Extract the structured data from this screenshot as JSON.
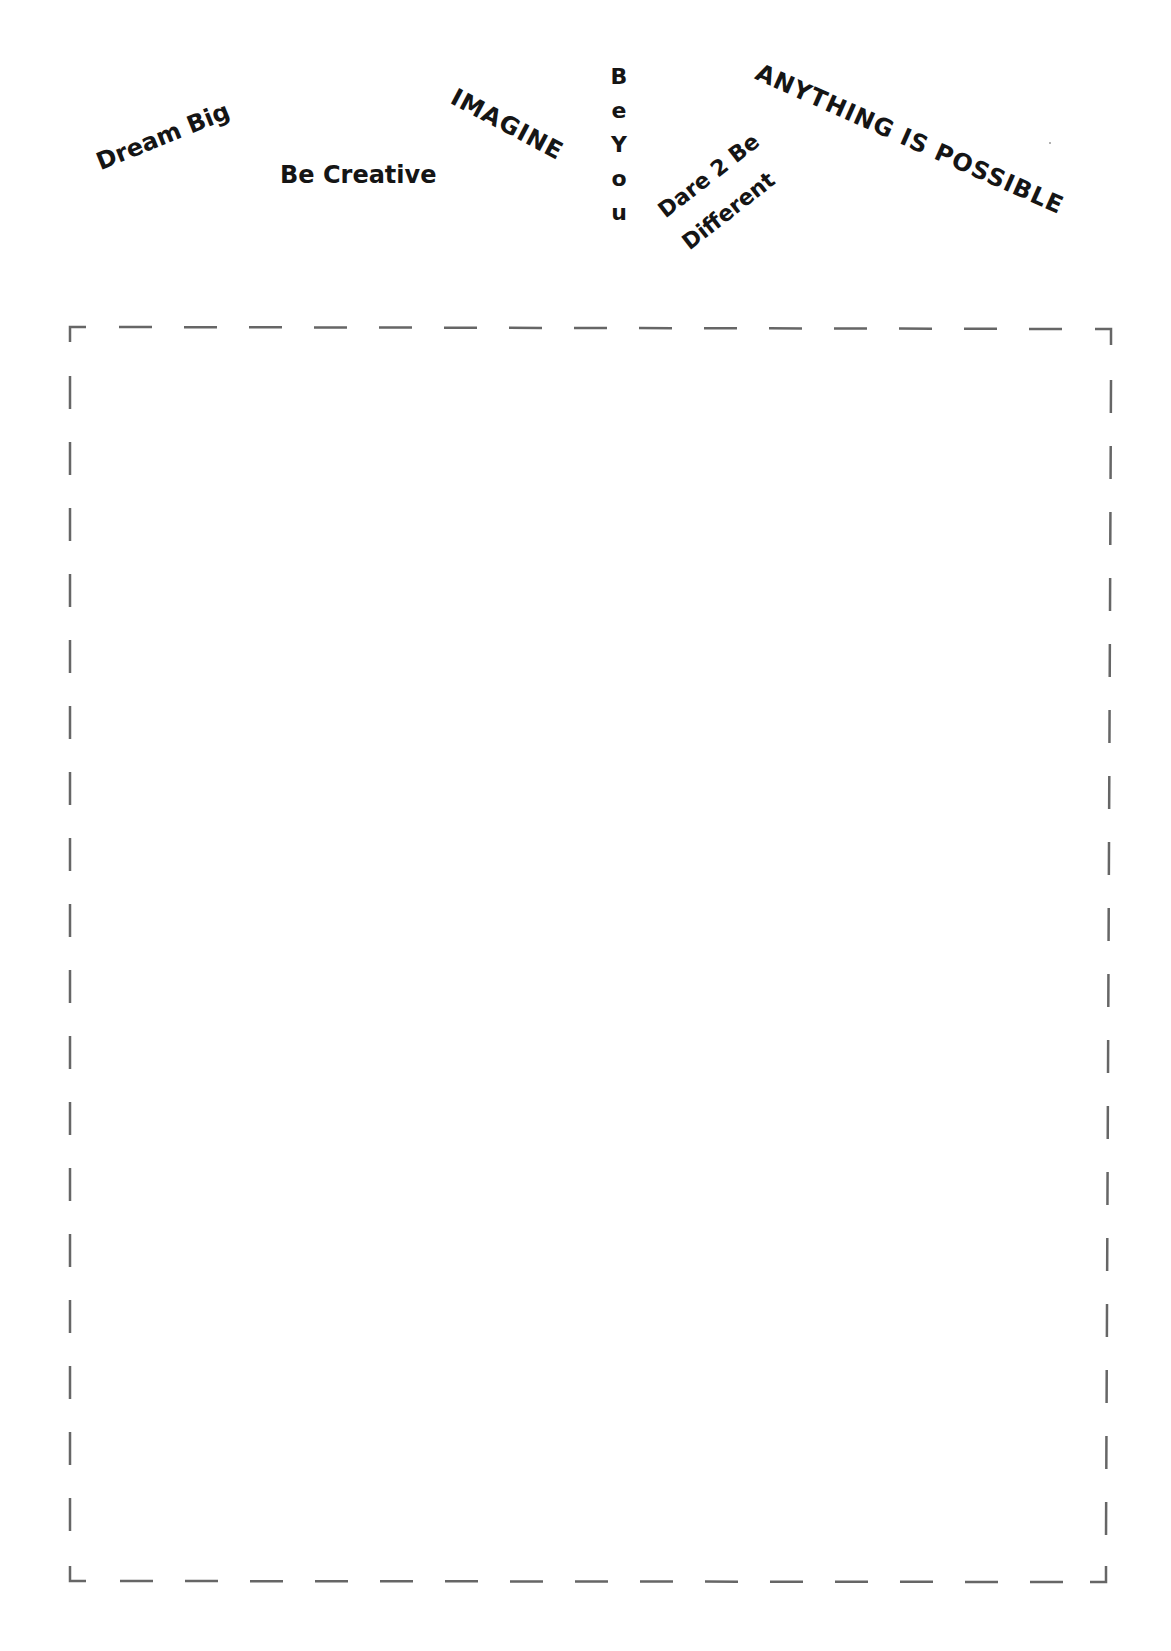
{
  "page": {
    "background": "#ffffff",
    "text_color": "#151515",
    "border_color": "#666666"
  },
  "phrases": {
    "dream_big": "Dream Big",
    "be_creative": "Be Creative",
    "imagine": "IMAGINE",
    "be_you": {
      "full": "Be You",
      "letters": [
        "B",
        "e",
        "Y",
        "o",
        "u"
      ]
    },
    "dare_to_be_different": {
      "line1": "Dare 2 Be",
      "line2": "Different"
    },
    "anything_is_possible": "ANYTHING IS POSSIBLE"
  },
  "drawing_area": {
    "style": "dashed",
    "bounds": {
      "left": 70,
      "top": 326,
      "right": 1111,
      "bottom": 1582
    },
    "content": ""
  }
}
